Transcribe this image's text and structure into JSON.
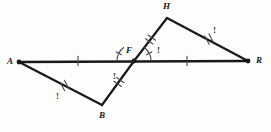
{
  "figure": {
    "background_color": "#fdfdfc",
    "stroke_color": "#181818",
    "mark_color": "#4a4a4a",
    "vertices": [
      {
        "name": "A",
        "label": "A",
        "x": 19,
        "y": 62,
        "label_x": 7,
        "label_y": 57,
        "dot": true
      },
      {
        "name": "B",
        "label": "B",
        "x": 102,
        "y": 105,
        "label_x": 99,
        "label_y": 111,
        "dot": false
      },
      {
        "name": "F",
        "label": "F",
        "x": 134,
        "y": 61,
        "label_x": 126,
        "label_y": 46,
        "dot": true
      },
      {
        "name": "H",
        "label": "H",
        "x": 167,
        "y": 18,
        "label_x": 163,
        "label_y": 2,
        "dot": false
      },
      {
        "name": "R",
        "label": "R",
        "x": 248,
        "y": 61,
        "label_x": 256,
        "label_y": 56,
        "dot": true
      }
    ],
    "segments": [
      {
        "name": "segment-AR",
        "from": "A",
        "to": "R",
        "width": 2.6
      },
      {
        "name": "segment-AB",
        "from": "A",
        "to": "B",
        "width": 2.2
      },
      {
        "name": "segment-BF",
        "from": "B",
        "to": "F",
        "width": 2.2
      },
      {
        "name": "segment-FH",
        "from": "F",
        "to": "H",
        "width": 2.2
      },
      {
        "name": "segment-HR",
        "from": "H",
        "to": "R",
        "width": 2.2
      }
    ],
    "tick_marks": [
      {
        "name": "tick-AF",
        "segment": "A-F",
        "count": 1,
        "x": 78,
        "y": 61,
        "angle": 90
      },
      {
        "name": "tick-FR",
        "segment": "F-R",
        "count": 1,
        "x": 187,
        "y": 61,
        "angle": 90
      },
      {
        "name": "tick-AB",
        "segment": "A-B",
        "count": 2,
        "x": 64.5,
        "y": 85.5,
        "angle": 62
      },
      {
        "name": "tick-BF",
        "segment": "B-F",
        "count": 2,
        "x": 119,
        "y": 82,
        "angle": 35
      },
      {
        "name": "tick-FH",
        "segment": "F-H",
        "count": 2,
        "x": 150.5,
        "y": 39.5,
        "angle": 35
      },
      {
        "name": "tick-HR",
        "segment": "H-R",
        "count": 2,
        "x": 209,
        "y": 39,
        "angle": 62
      }
    ],
    "angle_arcs": [
      {
        "name": "angle-arc-BFA",
        "cx": 134,
        "cy": 61,
        "radius": 17,
        "start_deg": 180,
        "end_deg": 234,
        "tick": true
      },
      {
        "name": "angle-arc-HFR",
        "cx": 134,
        "cy": 61,
        "radius": 17,
        "start_deg": 0,
        "end_deg": -54,
        "tick": true
      }
    ],
    "mark_labels": [
      {
        "name": "congruence-mark-AB",
        "text": "!",
        "x": 56,
        "y": 92
      },
      {
        "name": "congruence-mark-BFA",
        "text": "!",
        "x": 113,
        "y": 72
      },
      {
        "name": "congruence-mark-HFR",
        "text": "!",
        "x": 157,
        "y": 46
      },
      {
        "name": "congruence-mark-HR",
        "text": "!",
        "x": 213,
        "y": 26
      }
    ]
  }
}
